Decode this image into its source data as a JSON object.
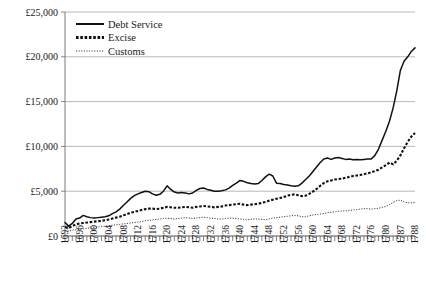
{
  "chart_data": {
    "type": "line",
    "title": "",
    "xlabel": "",
    "ylabel": "",
    "ylim": [
      0,
      25000
    ],
    "xlim": [
      1692,
      1788
    ],
    "grid": true,
    "legend_position": "top-left-inside",
    "y_ticks": [
      0,
      5000,
      10000,
      15000,
      20000,
      25000
    ],
    "y_tick_labels": [
      "£0",
      "£5,000",
      "£10,000",
      "£15,000",
      "£20,000",
      "£25,000"
    ],
    "x_tick_labels": [
      "1692",
      "1696",
      "1700",
      "1704",
      "1708",
      "1712",
      "1716",
      "1720",
      "1724",
      "1728",
      "1732",
      "1736",
      "1740",
      "1744",
      "1748",
      "1752",
      "1756",
      "1760",
      "1764",
      "1768",
      "1772",
      "1776",
      "1780",
      "1787",
      "1788"
    ],
    "x": [
      1692,
      1693,
      1694,
      1695,
      1696,
      1697,
      1698,
      1699,
      1700,
      1701,
      1702,
      1703,
      1704,
      1705,
      1706,
      1707,
      1708,
      1709,
      1710,
      1711,
      1712,
      1713,
      1714,
      1715,
      1716,
      1717,
      1718,
      1719,
      1720,
      1721,
      1722,
      1723,
      1724,
      1725,
      1726,
      1727,
      1728,
      1729,
      1730,
      1731,
      1732,
      1733,
      1734,
      1735,
      1736,
      1737,
      1738,
      1739,
      1740,
      1741,
      1742,
      1743,
      1744,
      1745,
      1746,
      1747,
      1748,
      1749,
      1750,
      1751,
      1752,
      1753,
      1754,
      1755,
      1756,
      1757,
      1758,
      1759,
      1760,
      1761,
      1762,
      1763,
      1764,
      1765,
      1766,
      1767,
      1768,
      1769,
      1770,
      1771,
      1772,
      1773,
      1774,
      1775,
      1776,
      1777,
      1778,
      1779,
      1780,
      1781,
      1782,
      1783,
      1784,
      1785,
      1786,
      1787,
      1788
    ],
    "series": [
      {
        "name": "Debt Service",
        "style": "solid",
        "values": [
          1500,
          1100,
          1400,
          1900,
          2000,
          2300,
          2150,
          2050,
          2000,
          2050,
          2100,
          2150,
          2250,
          2500,
          2700,
          3000,
          3400,
          3800,
          4200,
          4500,
          4700,
          4850,
          5000,
          4950,
          4700,
          4550,
          4650,
          5000,
          5600,
          5200,
          4900,
          4800,
          4850,
          4800,
          4700,
          4800,
          5100,
          5300,
          5350,
          5200,
          5100,
          5000,
          5000,
          5050,
          5150,
          5350,
          5650,
          5900,
          6200,
          6100,
          5950,
          5850,
          5800,
          5850,
          6200,
          6600,
          6900,
          6700,
          5900,
          5850,
          5750,
          5700,
          5600,
          5550,
          5600,
          5900,
          6300,
          6700,
          7200,
          7700,
          8200,
          8600,
          8700,
          8550,
          8700,
          8750,
          8650,
          8550,
          8600,
          8500,
          8550,
          8500,
          8550,
          8600,
          8600,
          9000,
          9700,
          10700,
          11700,
          12800,
          14300,
          16200,
          18500,
          19500,
          20000,
          20600,
          21000
        ]
      },
      {
        "name": "Excise",
        "style": "dashed",
        "values": [
          1000,
          900,
          1100,
          1300,
          1400,
          1450,
          1500,
          1550,
          1600,
          1650,
          1700,
          1750,
          1850,
          1950,
          2050,
          2150,
          2300,
          2450,
          2600,
          2700,
          2800,
          2900,
          3000,
          3050,
          3050,
          3000,
          3050,
          3150,
          3250,
          3200,
          3150,
          3150,
          3200,
          3250,
          3200,
          3150,
          3250,
          3300,
          3350,
          3300,
          3250,
          3200,
          3250,
          3300,
          3400,
          3450,
          3500,
          3550,
          3600,
          3500,
          3450,
          3500,
          3550,
          3600,
          3700,
          3800,
          3950,
          4050,
          4150,
          4250,
          4350,
          4500,
          4600,
          4650,
          4550,
          4450,
          4500,
          4700,
          4950,
          5250,
          5600,
          5900,
          6100,
          6200,
          6300,
          6350,
          6400,
          6500,
          6600,
          6700,
          6750,
          6800,
          6900,
          7000,
          7100,
          7250,
          7400,
          7650,
          7900,
          8200,
          8000,
          8400,
          9000,
          9800,
          10500,
          11100,
          11500
        ]
      },
      {
        "name": "Customs",
        "style": "dotted",
        "values": [
          600,
          550,
          650,
          700,
          750,
          800,
          850,
          900,
          950,
          1000,
          1050,
          1100,
          1150,
          1200,
          1250,
          1300,
          1350,
          1400,
          1450,
          1500,
          1550,
          1600,
          1700,
          1750,
          1800,
          1850,
          1900,
          1950,
          2000,
          1950,
          1900,
          1950,
          2000,
          2050,
          2000,
          1950,
          2000,
          2050,
          2100,
          2050,
          2000,
          1950,
          1900,
          1900,
          1950,
          2000,
          2000,
          1950,
          1900,
          1850,
          1800,
          1850,
          1900,
          1900,
          1850,
          1800,
          1900,
          2000,
          2050,
          2100,
          2150,
          2200,
          2250,
          2300,
          2250,
          2150,
          2150,
          2250,
          2350,
          2400,
          2450,
          2500,
          2600,
          2650,
          2700,
          2750,
          2800,
          2800,
          2850,
          2900,
          2950,
          3000,
          3050,
          3050,
          3000,
          3050,
          3100,
          3200,
          3300,
          3500,
          3750,
          3950,
          4000,
          3800,
          3700,
          3700,
          3750
        ]
      }
    ]
  },
  "legend": {
    "items": [
      {
        "label": "Debt Service"
      },
      {
        "label": "Excise"
      },
      {
        "label": "Customs"
      }
    ]
  }
}
